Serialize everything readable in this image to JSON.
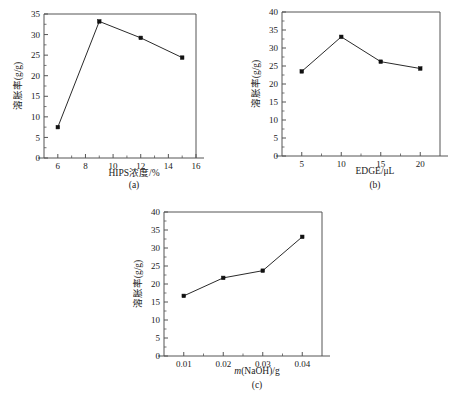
{
  "figure": {
    "caption_a": "(a)",
    "caption_b": "(b)",
    "caption_c": "(c)"
  },
  "chart_data": [
    {
      "id": "a",
      "type": "line",
      "title": "",
      "xlabel": "HIPS浓度/%",
      "ylabel": "溶胀率(g/g)",
      "x": [
        6,
        9,
        12,
        15
      ],
      "values": [
        7.5,
        33.2,
        29.2,
        24.4
      ],
      "xlim": [
        5,
        16
      ],
      "ylim": [
        0,
        35
      ],
      "xticks": [
        6,
        8,
        10,
        12,
        14,
        16
      ],
      "xticklabels": [
        "6",
        "8",
        "10",
        "12",
        "14",
        "16"
      ],
      "yticks": [
        0,
        5,
        10,
        15,
        20,
        25,
        30,
        35
      ],
      "yticklabels": [
        "0",
        "5",
        "10",
        "15",
        "20",
        "25",
        "30",
        "35"
      ],
      "grid": false,
      "legend": "none",
      "marker": "square",
      "caption": "(a)"
    },
    {
      "id": "b",
      "type": "line",
      "title": "",
      "xlabel": "EDGE/μL",
      "ylabel": "溶胀率(g/g)",
      "x": [
        5,
        10,
        15,
        20
      ],
      "values": [
        23.5,
        33.1,
        26.2,
        24.3
      ],
      "xlim": [
        2.5,
        22.5
      ],
      "ylim": [
        0,
        40
      ],
      "xticks": [
        5,
        10,
        15,
        20
      ],
      "xticklabels": [
        "5",
        "10",
        "15",
        "20"
      ],
      "yticks": [
        0,
        5,
        10,
        15,
        20,
        25,
        30,
        35,
        40
      ],
      "yticklabels": [
        "0",
        "5",
        "10",
        "15",
        "20",
        "25",
        "30",
        "35",
        "40"
      ],
      "grid": false,
      "legend": "none",
      "marker": "square",
      "caption": "(b)"
    },
    {
      "id": "c",
      "type": "line",
      "title": "",
      "xlabel_italic": "m",
      "xlabel_rest": "(NaOH)/g",
      "xlabel": "m(NaOH)/g",
      "ylabel": "溶胀率(g/g)",
      "x": [
        0.01,
        0.02,
        0.03,
        0.04
      ],
      "values": [
        16.7,
        21.7,
        23.7,
        33.1
      ],
      "xlim": [
        0.005,
        0.045
      ],
      "ylim": [
        0,
        40
      ],
      "xticks": [
        0.01,
        0.02,
        0.03,
        0.04
      ],
      "xticklabels": [
        "0.01",
        "0.02",
        "0.03",
        "0.04"
      ],
      "yticks": [
        0,
        5,
        10,
        15,
        20,
        25,
        30,
        35,
        40
      ],
      "yticklabels": [
        "0",
        "5",
        "10",
        "15",
        "20",
        "25",
        "30",
        "35",
        "40"
      ],
      "grid": false,
      "legend": "none",
      "marker": "square",
      "caption": "(c)"
    }
  ]
}
